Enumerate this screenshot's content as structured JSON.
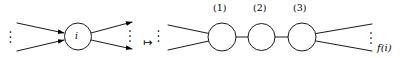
{
  "figure": {
    "background_color": "#ffffff",
    "stroke_color": "#000000",
    "left_graph": {
      "center_node_label": "i",
      "in_edge_count": 2,
      "out_edge_count": 2,
      "in_ellipsis": "vertical-dots",
      "out_ellipsis": "vertical-dots"
    },
    "map_symbol": "↦",
    "right_graph": {
      "nodes": [
        {
          "label": "(1)"
        },
        {
          "label": "(2)"
        },
        {
          "label": "(3)"
        }
      ],
      "in_edge_count": 2,
      "out_edge_count": 2,
      "in_ellipsis": "vertical-dots",
      "out_ellipsis": "vertical-dots",
      "output_label": "f(i)"
    }
  }
}
